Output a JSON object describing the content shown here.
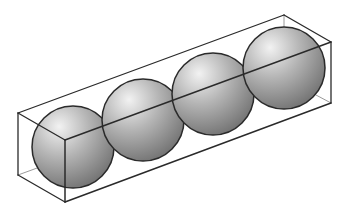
{
  "diagram": {
    "title": "Four spheres packed in a rectangular box",
    "colors": {
      "background": "#ffffff",
      "edge": "#2a2a2a",
      "hidden_edge": "#9a9a9a",
      "sphere_highlight": "#f2f2f2",
      "sphere_mid": "#b4b4b4",
      "sphere_shadow": "#6e6e6e"
    },
    "box": {
      "back_top_left": [
        18,
        113
      ],
      "front_top_left": [
        65,
        140
      ],
      "front_bottom_left": [
        65,
        202
      ],
      "back_bottom_left": [
        18,
        175
      ],
      "back_top_right": [
        284,
        15
      ],
      "front_top_right": [
        331,
        42
      ],
      "front_bottom_right": [
        331,
        103
      ],
      "back_bottom_right": [
        284,
        78
      ]
    },
    "spheres": [
      {
        "label": "sphere-1",
        "cx": 73,
        "cy": 147,
        "r": 41
      },
      {
        "label": "sphere-2",
        "cx": 143,
        "cy": 120,
        "r": 41
      },
      {
        "label": "sphere-3",
        "cx": 213,
        "cy": 94,
        "r": 41
      },
      {
        "label": "sphere-4",
        "cx": 284,
        "cy": 68,
        "r": 41
      }
    ],
    "sphere_count": "4"
  }
}
